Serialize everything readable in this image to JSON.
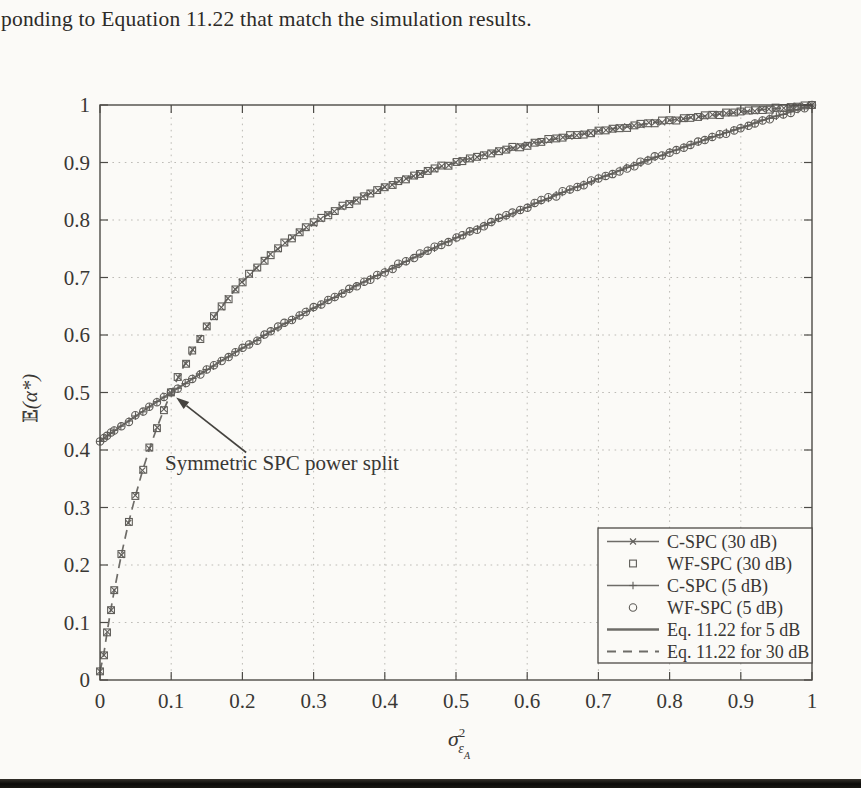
{
  "page": {
    "top_text": "ponding to Equation 11.22 that match the simulation results.",
    "background_color": "#fbfaf7",
    "bottom_bar_color": "#0c0b09"
  },
  "chart_data": {
    "type": "line",
    "title": "",
    "xlabel": {
      "symbol": "σ",
      "superscript": "2",
      "subscript": "ε",
      "subsubscript": "A"
    },
    "ylabel": "E(α*)",
    "xlim": [
      0,
      1
    ],
    "ylim": [
      0,
      1
    ],
    "grid": "dotted",
    "xticks": [
      "0",
      "0.1",
      "0.2",
      "0.3",
      "0.4",
      "0.5",
      "0.6",
      "0.7",
      "0.8",
      "0.9",
      "1"
    ],
    "yticks": [
      "0",
      "0.1",
      "0.2",
      "0.3",
      "0.4",
      "0.5",
      "0.6",
      "0.7",
      "0.8",
      "0.9",
      "1"
    ],
    "annotation": {
      "text": "Symmetric SPC power split",
      "points_to": {
        "x": 0.1,
        "y": 0.5
      }
    },
    "legend": {
      "position": "lower right",
      "entries": [
        {
          "label": "C-SPC (30 dB)",
          "style": "line-x"
        },
        {
          "label": "WF-SPC (30 dB)",
          "style": "square"
        },
        {
          "label": "C-SPC (5 dB)",
          "style": "line-plus"
        },
        {
          "label": "WF-SPC (5 dB)",
          "style": "circle"
        },
        {
          "label": "Eq. 11.22 for 5 dB",
          "style": "solid-line"
        },
        {
          "label": "Eq. 11.22 for 30 dB",
          "style": "dashed-line"
        }
      ]
    },
    "x": [
      0,
      0.005,
      0.01,
      0.015,
      0.02,
      0.03,
      0.04,
      0.05,
      0.06,
      0.07,
      0.08,
      0.09,
      0.1,
      0.11,
      0.12,
      0.13,
      0.14,
      0.15,
      0.16,
      0.17,
      0.18,
      0.19,
      0.2,
      0.21,
      0.22,
      0.23,
      0.24,
      0.25,
      0.26,
      0.27,
      0.28,
      0.29,
      0.3,
      0.31,
      0.32,
      0.33,
      0.34,
      0.35,
      0.36,
      0.37,
      0.38,
      0.39,
      0.4,
      0.41,
      0.42,
      0.43,
      0.44,
      0.45,
      0.46,
      0.47,
      0.48,
      0.49,
      0.5,
      0.51,
      0.52,
      0.53,
      0.54,
      0.55,
      0.56,
      0.57,
      0.58,
      0.59,
      0.6,
      0.61,
      0.62,
      0.63,
      0.64,
      0.65,
      0.66,
      0.67,
      0.68,
      0.69,
      0.7,
      0.71,
      0.72,
      0.73,
      0.74,
      0.75,
      0.76,
      0.77,
      0.78,
      0.79,
      0.8,
      0.81,
      0.82,
      0.83,
      0.84,
      0.85,
      0.86,
      0.87,
      0.88,
      0.89,
      0.9,
      0.91,
      0.92,
      0.93,
      0.94,
      0.95,
      0.96,
      0.97,
      0.98,
      0.99,
      1.0
    ],
    "series": [
      {
        "name": "30 dB (C-SPC, WF-SPC, Eq. 11.22)",
        "line": "dashed",
        "markers": [
          "x",
          "square"
        ],
        "y": [
          0.015,
          0.043,
          0.083,
          0.121,
          0.155,
          0.218,
          0.273,
          0.321,
          0.365,
          0.404,
          0.439,
          0.471,
          0.5,
          0.527,
          0.551,
          0.574,
          0.594,
          0.614,
          0.632,
          0.648,
          0.664,
          0.679,
          0.692,
          0.705,
          0.717,
          0.729,
          0.74,
          0.75,
          0.76,
          0.769,
          0.778,
          0.786,
          0.794,
          0.802,
          0.809,
          0.816,
          0.823,
          0.829,
          0.835,
          0.841,
          0.847,
          0.852,
          0.857,
          0.862,
          0.867,
          0.872,
          0.876,
          0.88,
          0.885,
          0.889,
          0.893,
          0.896,
          0.9,
          0.904,
          0.907,
          0.91,
          0.914,
          0.917,
          0.92,
          0.923,
          0.926,
          0.928,
          0.931,
          0.934,
          0.936,
          0.939,
          0.941,
          0.944,
          0.946,
          0.948,
          0.95,
          0.952,
          0.955,
          0.957,
          0.959,
          0.961,
          0.962,
          0.964,
          0.966,
          0.968,
          0.97,
          0.971,
          0.973,
          0.975,
          0.976,
          0.978,
          0.979,
          0.981,
          0.982,
          0.984,
          0.985,
          0.986,
          0.988,
          0.989,
          0.99,
          0.992,
          0.993,
          0.994,
          0.995,
          0.997,
          0.998,
          0.999,
          1.0
        ]
      },
      {
        "name": "5 dB (C-SPC, WF-SPC, Eq. 11.22)",
        "line": "solid",
        "markers": [
          "plus",
          "circle"
        ],
        "y": [
          0.415,
          0.42,
          0.424,
          0.429,
          0.433,
          0.442,
          0.45,
          0.459,
          0.467,
          0.476,
          0.484,
          0.492,
          0.5,
          0.508,
          0.516,
          0.524,
          0.532,
          0.539,
          0.547,
          0.555,
          0.562,
          0.57,
          0.577,
          0.584,
          0.591,
          0.599,
          0.606,
          0.613,
          0.62,
          0.626,
          0.633,
          0.64,
          0.647,
          0.653,
          0.66,
          0.666,
          0.673,
          0.679,
          0.686,
          0.692,
          0.698,
          0.704,
          0.71,
          0.716,
          0.722,
          0.728,
          0.734,
          0.74,
          0.746,
          0.752,
          0.758,
          0.763,
          0.769,
          0.774,
          0.78,
          0.785,
          0.791,
          0.796,
          0.802,
          0.807,
          0.812,
          0.817,
          0.822,
          0.828,
          0.833,
          0.838,
          0.843,
          0.848,
          0.853,
          0.858,
          0.862,
          0.867,
          0.872,
          0.877,
          0.881,
          0.886,
          0.891,
          0.895,
          0.9,
          0.904,
          0.909,
          0.913,
          0.918,
          0.922,
          0.927,
          0.931,
          0.935,
          0.94,
          0.944,
          0.948,
          0.952,
          0.956,
          0.96,
          0.964,
          0.969,
          0.973,
          0.977,
          0.981,
          0.984,
          0.988,
          0.992,
          0.996,
          1.0
        ]
      }
    ],
    "colors": {
      "curve": "#6e6c68",
      "marker": "#5f5d59",
      "grid": "#bdbbb6",
      "frame": "#4d4b47",
      "text": "#393734"
    }
  }
}
